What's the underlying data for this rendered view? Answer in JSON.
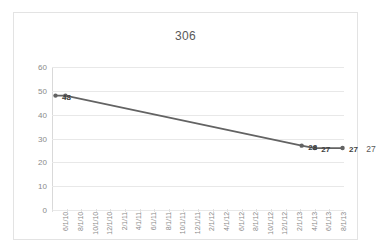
{
  "chart_data": {
    "type": "line",
    "title": "306",
    "xlabel": "",
    "ylabel": "",
    "ylim": [
      0,
      60
    ],
    "yticks": [
      0,
      10,
      20,
      30,
      40,
      50,
      60
    ],
    "grid": true,
    "legend": "none",
    "categories": [
      "6/1/10",
      "8/1/10",
      "10/1/10",
      "12/1/10",
      "2/1/11",
      "4/1/11",
      "6/1/11",
      "8/1/11",
      "10/1/11",
      "12/1/11",
      "2/1/12",
      "4/1/12",
      "6/1/12",
      "8/1/12",
      "10/1/12",
      "12/1/12",
      "2/1/13",
      "4/1/13",
      "6/1/13",
      "8/1/13"
    ],
    "series": [
      {
        "name": "306",
        "color": "#636363",
        "points": [
          {
            "x": "6/1/10",
            "x_frac": 0.012,
            "y": 48,
            "label": "48"
          },
          {
            "x": "7/1/10",
            "x_frac": 0.046,
            "y": 48,
            "label": ""
          },
          {
            "x": "2/15/13",
            "x_frac": 0.855,
            "y": 27,
            "label": "28"
          },
          {
            "x": "4/1/13",
            "x_frac": 0.9,
            "y": 26,
            "label": "27"
          },
          {
            "x": "8/1/13",
            "x_frac": 0.995,
            "y": 26,
            "label": "27"
          }
        ]
      }
    ],
    "annotations": [
      {
        "text": "27",
        "x_frac": 1.055,
        "y": 26
      }
    ]
  }
}
